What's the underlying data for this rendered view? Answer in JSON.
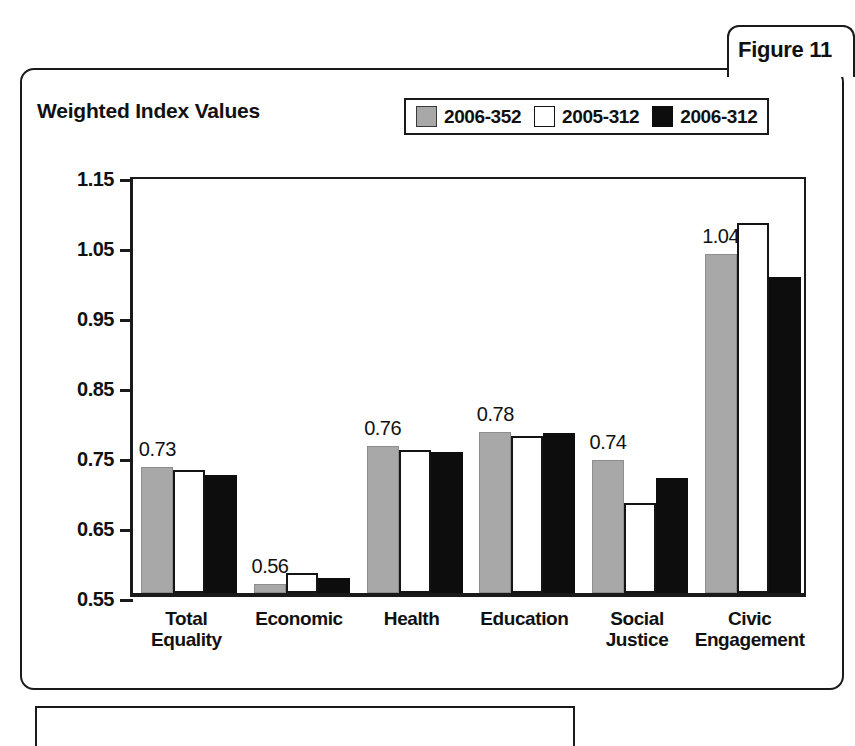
{
  "figure": {
    "tab_label": "Figure 11"
  },
  "chart_data": {
    "type": "bar",
    "title": "Weighted Index Values",
    "xlabel": "",
    "ylabel": "",
    "ylim": [
      0.55,
      1.15
    ],
    "ytick_labels": [
      "1.15",
      "1.05",
      "0.95",
      "0.85",
      "0.75",
      "0.65",
      "0.55"
    ],
    "yticks": [
      1.15,
      1.05,
      0.95,
      0.85,
      0.75,
      0.65,
      0.55
    ],
    "grid": false,
    "legend_position": "top-right",
    "categories": [
      "Total\nEquality",
      "Economic",
      "Health",
      "Education",
      "Social\nJustice",
      "Civic\nEngagement"
    ],
    "category_lines": [
      [
        "Total",
        "Equality"
      ],
      [
        "Economic"
      ],
      [
        "Health"
      ],
      [
        "Education"
      ],
      [
        "Social",
        "Justice"
      ],
      [
        "Civic",
        "Engagement"
      ]
    ],
    "series": [
      {
        "name": "2006-352",
        "color": "#a8a8a8",
        "values": [
          0.73,
          0.563,
          0.76,
          0.78,
          0.74,
          1.035
        ]
      },
      {
        "name": "2005-312",
        "color": "#ffffff",
        "values": [
          0.726,
          0.578,
          0.755,
          0.774,
          0.679,
          1.078
        ]
      },
      {
        "name": "2006-312",
        "color": "#0d0d0d",
        "values": [
          0.718,
          0.572,
          0.752,
          0.778,
          0.715,
          1.001
        ]
      }
    ],
    "value_labels": [
      "0.73",
      "0.56",
      "0.76",
      "0.78",
      "0.74",
      "1.04"
    ],
    "value_label_series_index": 0
  }
}
